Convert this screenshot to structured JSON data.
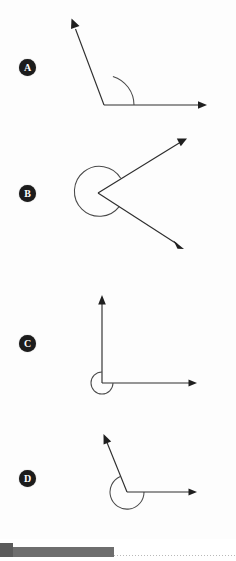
{
  "page": {
    "background_color": "#ffffff",
    "width": 236,
    "height": 561
  },
  "figures": [
    {
      "label": "A",
      "label_color": "#1c1c1c",
      "label_text_color": "#ffffff",
      "angle_type": "obtuse",
      "marked_angle_degrees": 135,
      "arc_style": "single-arc-interior",
      "vertex": {
        "x": 104,
        "y": 105
      },
      "rays": [
        {
          "name": "horizontal-right-ray",
          "to_x": 206,
          "to_y": 105,
          "arrowhead": true
        },
        {
          "name": "upper-left-ray",
          "to_x": 72,
          "to_y": 21,
          "arrowhead": true
        }
      ],
      "arc_radius": 30
    },
    {
      "label": "B",
      "label_color": "#1c1c1c",
      "label_text_color": "#ffffff",
      "angle_type": "reflex",
      "marked_angle_degrees": 305,
      "arc_style": "reflex-arc-exterior",
      "vertex": {
        "x": 98,
        "y": 193
      },
      "rays": [
        {
          "name": "upper-right-ray",
          "to_x": 186,
          "to_y": 139,
          "arrowhead": true
        },
        {
          "name": "lower-right-ray",
          "to_x": 183,
          "to_y": 249,
          "arrowhead": true
        }
      ],
      "arc_radius": 25
    },
    {
      "label": "C",
      "label_color": "#1c1c1c",
      "label_text_color": "#ffffff",
      "angle_type": "reflex",
      "marked_angle_degrees": 270,
      "arc_style": "reflex-arc-exterior",
      "vertex": {
        "x": 102,
        "y": 383
      },
      "rays": [
        {
          "name": "vertical-up-ray",
          "to_x": 102,
          "to_y": 296,
          "arrowhead": true
        },
        {
          "name": "horizontal-right-ray",
          "to_x": 196,
          "to_y": 383,
          "arrowhead": true
        }
      ],
      "arc_radius": 11
    },
    {
      "label": "D",
      "label_color": "#1c1c1c",
      "label_text_color": "#ffffff",
      "angle_type": "reflex",
      "marked_angle_degrees": 250,
      "arc_style": "reflex-arc-exterior",
      "vertex": {
        "x": 127,
        "y": 492
      },
      "rays": [
        {
          "name": "upper-left-ray",
          "to_x": 104,
          "to_y": 435,
          "arrowhead": true
        },
        {
          "name": "horizontal-right-ray",
          "to_x": 196,
          "to_y": 492,
          "arrowhead": true
        }
      ],
      "arc_radius": 17
    }
  ],
  "bottom_strip": {
    "handle_color": "#5b5b5b",
    "bar_color": "#6e6e6e",
    "dotted_line_color": "#b9b9b9"
  }
}
